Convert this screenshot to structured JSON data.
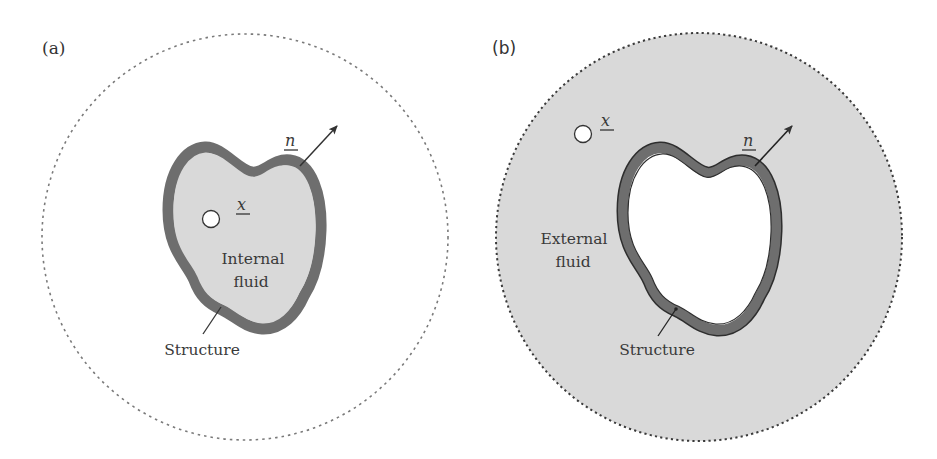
{
  "figure": {
    "panels": [
      {
        "id": "a",
        "tag": "(a)",
        "fluid_label_line1": "Internal",
        "fluid_label_line2": "fluid",
        "structure_label": "Structure",
        "point_label": "x",
        "normal_label": "n",
        "fluid_region": "inside",
        "colors": {
          "fluid": "#d9d9d9",
          "structure": "#6e6e6e",
          "boundary_dash": "#7a7a7a",
          "outside": "#ffffff"
        }
      },
      {
        "id": "b",
        "tag": "(b)",
        "fluid_label_line1": "External",
        "fluid_label_line2": "fluid",
        "structure_label": "Structure",
        "point_label": "x",
        "normal_label": "n",
        "fluid_region": "outside",
        "colors": {
          "fluid": "#d9d9d9",
          "structure": "#6e6e6e",
          "boundary_dash": "#3a3a3a",
          "inside": "#ffffff"
        }
      }
    ]
  }
}
